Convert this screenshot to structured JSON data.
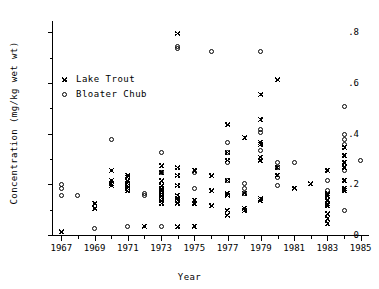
{
  "chart_data": {
    "type": "scatter",
    "title": "",
    "xlabel": "Year",
    "ylabel": "Concentration (mg/kg wet wt)",
    "xlim": [
      1966.5,
      1985.5
    ],
    "ylim": [
      0.0,
      0.84
    ],
    "grid": false,
    "legend_position": "upper-left-inside",
    "x_ticks": [
      1967,
      1969,
      1971,
      1973,
      1975,
      1977,
      1979,
      1981,
      1983,
      1985
    ],
    "x_tick_labels": [
      "1967",
      "1969",
      "1971",
      "1973",
      "1975",
      "1977",
      "1979",
      "1981",
      "1983",
      "1985"
    ],
    "x_minor_ticks": [
      1968,
      1970,
      1972,
      1974,
      1976,
      1978,
      1980,
      1982,
      1984
    ],
    "y_ticks": [
      0.0,
      0.2,
      0.4,
      0.6,
      0.8
    ],
    "y_tick_labels": [
      "0",
      ".2",
      ".4",
      ".6",
      ".8"
    ],
    "y_minor_ticks": [
      0.1,
      0.3,
      0.5,
      0.7
    ],
    "series": [
      {
        "name": "Lake Trout",
        "marker": "asterisk",
        "color": "#000000",
        "points": [
          [
            1967,
            0.015
          ],
          [
            1969,
            0.105
          ],
          [
            1969,
            0.125
          ],
          [
            1970,
            0.195
          ],
          [
            1970,
            0.205
          ],
          [
            1970,
            0.215
          ],
          [
            1970,
            0.255
          ],
          [
            1971,
            0.175
          ],
          [
            1971,
            0.185
          ],
          [
            1971,
            0.195
          ],
          [
            1971,
            0.205
          ],
          [
            1971,
            0.215
          ],
          [
            1971,
            0.225
          ],
          [
            1971,
            0.235
          ],
          [
            1972,
            0.035
          ],
          [
            1973,
            0.125
          ],
          [
            1973,
            0.135
          ],
          [
            1973,
            0.145
          ],
          [
            1973,
            0.155
          ],
          [
            1973,
            0.165
          ],
          [
            1973,
            0.175
          ],
          [
            1973,
            0.185
          ],
          [
            1973,
            0.195
          ],
          [
            1973,
            0.215
          ],
          [
            1973,
            0.245
          ],
          [
            1973,
            0.275
          ],
          [
            1974,
            0.795
          ],
          [
            1974,
            0.035
          ],
          [
            1974,
            0.125
          ],
          [
            1974,
            0.135
          ],
          [
            1974,
            0.145
          ],
          [
            1974,
            0.155
          ],
          [
            1974,
            0.195
          ],
          [
            1974,
            0.235
          ],
          [
            1974,
            0.265
          ],
          [
            1975,
            0.035
          ],
          [
            1975,
            0.125
          ],
          [
            1975,
            0.135
          ],
          [
            1975,
            0.255
          ],
          [
            1976,
            0.115
          ],
          [
            1976,
            0.175
          ],
          [
            1976,
            0.235
          ],
          [
            1977,
            0.075
          ],
          [
            1977,
            0.095
          ],
          [
            1977,
            0.155
          ],
          [
            1977,
            0.165
          ],
          [
            1977,
            0.215
          ],
          [
            1977,
            0.295
          ],
          [
            1977,
            0.325
          ],
          [
            1977,
            0.435
          ],
          [
            1978,
            0.095
          ],
          [
            1978,
            0.105
          ],
          [
            1978,
            0.165
          ],
          [
            1978,
            0.385
          ],
          [
            1979,
            0.135
          ],
          [
            1979,
            0.145
          ],
          [
            1979,
            0.295
          ],
          [
            1979,
            0.305
          ],
          [
            1979,
            0.355
          ],
          [
            1979,
            0.365
          ],
          [
            1979,
            0.455
          ],
          [
            1979,
            0.555
          ],
          [
            1980,
            0.235
          ],
          [
            1980,
            0.265
          ],
          [
            1980,
            0.615
          ],
          [
            1981,
            0.185
          ],
          [
            1982,
            0.205
          ],
          [
            1983,
            0.045
          ],
          [
            1983,
            0.065
          ],
          [
            1983,
            0.085
          ],
          [
            1983,
            0.115
          ],
          [
            1983,
            0.125
          ],
          [
            1983,
            0.135
          ],
          [
            1983,
            0.155
          ],
          [
            1983,
            0.165
          ],
          [
            1983,
            0.255
          ],
          [
            1984,
            0.175
          ],
          [
            1984,
            0.185
          ],
          [
            1984,
            0.215
          ],
          [
            1984,
            0.265
          ],
          [
            1984,
            0.285
          ],
          [
            1984,
            0.315
          ],
          [
            1984,
            0.345
          ]
        ]
      },
      {
        "name": "Bloater Chub",
        "marker": "circle",
        "color": "#000000",
        "points": [
          [
            1967,
            0.185
          ],
          [
            1967,
            0.2
          ],
          [
            1967,
            0.155
          ],
          [
            1968,
            0.155
          ],
          [
            1969,
            0.025
          ],
          [
            1970,
            0.375
          ],
          [
            1971,
            0.035
          ],
          [
            1972,
            0.155
          ],
          [
            1972,
            0.165
          ],
          [
            1973,
            0.325
          ],
          [
            1973,
            0.245
          ],
          [
            1973,
            0.035
          ],
          [
            1974,
            0.745
          ],
          [
            1974,
            0.735
          ],
          [
            1975,
            0.185
          ],
          [
            1975,
            0.245
          ],
          [
            1976,
            0.725
          ],
          [
            1977,
            0.285
          ],
          [
            1977,
            0.325
          ],
          [
            1977,
            0.365
          ],
          [
            1977,
            0.215
          ],
          [
            1978,
            0.165
          ],
          [
            1978,
            0.185
          ],
          [
            1978,
            0.205
          ],
          [
            1979,
            0.725
          ],
          [
            1979,
            0.335
          ],
          [
            1979,
            0.405
          ],
          [
            1979,
            0.415
          ],
          [
            1980,
            0.195
          ],
          [
            1980,
            0.225
          ],
          [
            1980,
            0.265
          ],
          [
            1980,
            0.285
          ],
          [
            1981,
            0.285
          ],
          [
            1983,
            0.175
          ],
          [
            1983,
            0.215
          ],
          [
            1984,
            0.095
          ],
          [
            1984,
            0.255
          ],
          [
            1984,
            0.355
          ],
          [
            1984,
            0.375
          ],
          [
            1984,
            0.395
          ],
          [
            1984,
            0.505
          ],
          [
            1985,
            0.295
          ]
        ]
      }
    ]
  },
  "legend": {
    "entries": [
      {
        "label": "Lake Trout",
        "marker": "asterisk-icon"
      },
      {
        "label": "Bloater Chub",
        "marker": "circle-icon"
      }
    ]
  }
}
